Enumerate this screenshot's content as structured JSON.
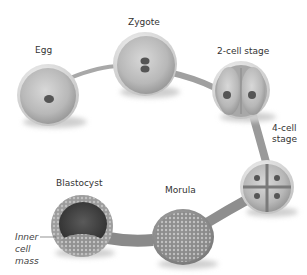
{
  "diagram": {
    "type": "embryonic-development-sequence",
    "stages": [
      {
        "id": "egg",
        "label": "Egg"
      },
      {
        "id": "zygote",
        "label": "Zygote"
      },
      {
        "id": "two-cell",
        "label": "2-cell stage"
      },
      {
        "id": "four-cell",
        "label_line1": "4-cell",
        "label_line2": "stage"
      },
      {
        "id": "morula",
        "label": "Morula"
      },
      {
        "id": "blastocyst",
        "label": "Blastocyst"
      }
    ],
    "annotations": {
      "inner_cell_mass": {
        "line1": "Inner",
        "line2": "cell",
        "line3": "mass"
      }
    },
    "colors": {
      "path": "#9a9a9a",
      "cell_body": "#bdbdbd",
      "cell_rim": "#e6e6e6",
      "nucleus": "#555555",
      "blastocyst_cavity": "#4a4a4a"
    }
  }
}
